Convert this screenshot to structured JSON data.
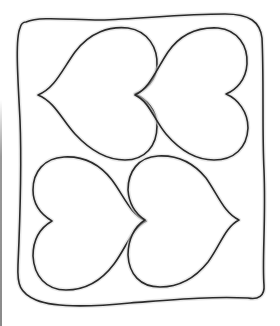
{
  "image": {
    "subject": "quilt block line drawing",
    "description": "Four outlined hearts arranged in a 2x2 grid inside a hand-drawn wavy rounded square border",
    "colors": {
      "background": "#ffffff",
      "ink": "#2a2a2a",
      "shading": "#d8d8d8",
      "edge_line": "#9a9a9a"
    },
    "border": {
      "shape": "wavy-rounded-rectangle"
    },
    "hearts": [
      {
        "position": "top-left",
        "points": "left"
      },
      {
        "position": "top-right",
        "points": "left"
      },
      {
        "position": "bottom-left",
        "points": "right"
      },
      {
        "position": "bottom-right",
        "points": "right"
      }
    ]
  }
}
